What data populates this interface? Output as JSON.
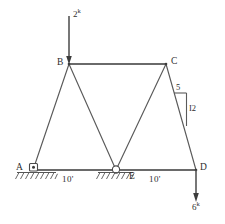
{
  "diagram": {
    "joints": [
      {
        "id": "A",
        "label": "A",
        "x": 33,
        "y": 170,
        "support": "pin"
      },
      {
        "id": "B",
        "label": "B",
        "x": 69,
        "y": 64,
        "support": "none"
      },
      {
        "id": "C",
        "label": "C",
        "x": 166,
        "y": 64,
        "support": "none"
      },
      {
        "id": "D",
        "label": "D",
        "x": 196,
        "y": 170,
        "support": "none"
      },
      {
        "id": "E",
        "label": "E",
        "x": 116,
        "y": 170,
        "support": "roller"
      }
    ],
    "members": [
      {
        "from": "A",
        "to": "B"
      },
      {
        "from": "B",
        "to": "C"
      },
      {
        "from": "B",
        "to": "E"
      },
      {
        "from": "E",
        "to": "C"
      },
      {
        "from": "C",
        "to": "D"
      },
      {
        "from": "A",
        "to": "E"
      },
      {
        "from": "E",
        "to": "D"
      }
    ],
    "loads": [
      {
        "id": "load-top",
        "label": "2",
        "unit": "k",
        "magnitude": 2,
        "direction": "down",
        "applied_at": "B",
        "label_x": 78,
        "label_y": 14
      },
      {
        "id": "load-right",
        "label": "6",
        "unit": "k",
        "magnitude": 6,
        "direction": "down",
        "applied_at": "D",
        "label_x": 197,
        "label_y": 206
      }
    ],
    "dimensions": [
      {
        "id": "span-ae",
        "label": "10'",
        "value": 10,
        "unit": "ft",
        "x": 62,
        "y": 177
      },
      {
        "id": "span-ed",
        "label": "10'",
        "value": 10,
        "unit": "ft",
        "x": 149,
        "y": 177
      }
    ],
    "slope_triangle": {
      "id": "slope-cd",
      "run_label": "5",
      "rise_label": "I2",
      "run": 5,
      "rise": 12,
      "run_x": 178,
      "run_y": 97,
      "rise_x": 189,
      "rise_y": 113
    },
    "colors": {
      "member": "#5a5a5a",
      "chord": "#6a6a6a",
      "load": "#3c3c3c",
      "ground": "#555555",
      "text": "#2e2e2e",
      "background": "#ffffff"
    }
  }
}
